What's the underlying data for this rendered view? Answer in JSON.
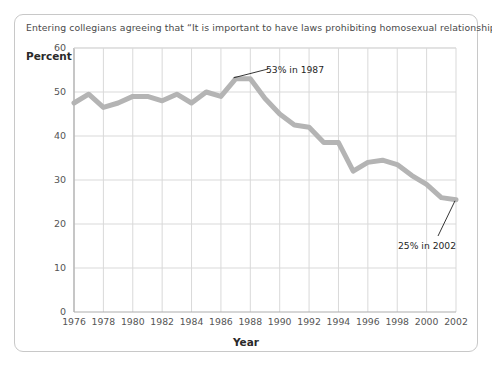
{
  "figure": {
    "title": "Entering collegians agreeing that “It is important to have laws prohibiting homosexual relationships.”",
    "border_color": "#c8c8c8",
    "background": "#ffffff"
  },
  "axes": {
    "y_label": "Percent",
    "x_label": "Year"
  },
  "annotations": [
    {
      "name": "peak-callout",
      "text": "53% in 1987"
    },
    {
      "name": "end-callout",
      "text": "25% in 2002"
    }
  ],
  "chart_data": {
    "type": "line",
    "title": "Entering collegians agreeing that “It is important to have laws prohibiting homosexual relationships.”",
    "xlabel": "Year",
    "ylabel": "Percent",
    "xlim": [
      1976,
      2002
    ],
    "ylim": [
      0,
      60
    ],
    "grid": true,
    "legend": null,
    "line_color": "#b4b4b4",
    "line_width": 5,
    "x_tick_labels": [
      "1976",
      "1978",
      "1980",
      "1982",
      "1984",
      "1986",
      "1988",
      "1990",
      "1992",
      "1994",
      "1996",
      "1998",
      "2000",
      "2002"
    ],
    "x_tick_values": [
      1976,
      1978,
      1980,
      1982,
      1984,
      1986,
      1988,
      1990,
      1992,
      1994,
      1996,
      1998,
      2000,
      2002
    ],
    "y_tick_labels": [
      "0",
      "10",
      "20",
      "30",
      "40",
      "50",
      "60"
    ],
    "y_tick_values": [
      0,
      10,
      20,
      30,
      40,
      50,
      60
    ],
    "x": [
      1976,
      1977,
      1978,
      1979,
      1980,
      1981,
      1982,
      1983,
      1984,
      1985,
      1986,
      1987,
      1988,
      1989,
      1990,
      1991,
      1992,
      1993,
      1994,
      1995,
      1996,
      1997,
      1998,
      1999,
      2000,
      2001,
      2002
    ],
    "values": [
      47.5,
      49.5,
      46.5,
      47.5,
      49,
      49,
      48,
      49.5,
      47.5,
      50,
      49,
      53,
      53,
      48.5,
      45,
      42.5,
      42,
      38.5,
      38.5,
      32,
      34,
      34.5,
      33.5,
      31,
      29,
      26,
      25.5
    ],
    "annotations": [
      {
        "text": "53% in 1987",
        "point_x": 1987,
        "point_y": 53
      },
      {
        "text": "25% in 2002",
        "point_x": 2002,
        "point_y": 25.5
      }
    ]
  }
}
